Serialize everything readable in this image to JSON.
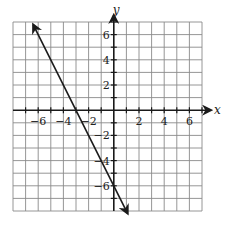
{
  "chart_data": {
    "type": "line",
    "title": "",
    "xlabel": "x",
    "ylabel": "y",
    "xlim": [
      -8,
      7
    ],
    "ylim": [
      -8,
      7
    ],
    "grid": true,
    "grid_step": 1,
    "x_ticks": [
      -6,
      -4,
      -2,
      2,
      4,
      6
    ],
    "x_tick_labels": [
      "−6",
      "−4",
      "−2",
      "2",
      "4",
      "6"
    ],
    "y_ticks": [
      -6,
      -4,
      -2,
      2,
      4,
      6
    ],
    "y_tick_labels": [
      "−6",
      "−4",
      "−2",
      "2",
      "4",
      "6"
    ],
    "series": [
      {
        "name": "line",
        "equation": "y = -2x - 6",
        "slope": -2,
        "intercept": -6,
        "x_intercept": -3,
        "points": [
          [
            -6.4,
            6.8
          ],
          [
            1.1,
            -8.2
          ]
        ],
        "arrows_both_ends": true
      }
    ],
    "legend": "none"
  },
  "colors": {
    "background": "#ffffff",
    "grid": "#8a8a8a",
    "axis": "#1a1a1a",
    "line": "#1a1a1a"
  }
}
